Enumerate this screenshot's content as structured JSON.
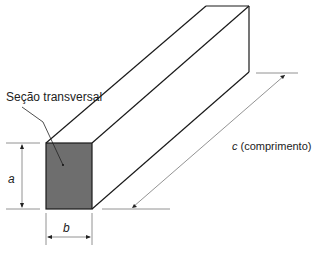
{
  "labels": {
    "cross_section": "Seção transversal",
    "a": "a",
    "b": "b",
    "c_var": "c",
    "c_desc": " (comprimento)"
  },
  "colors": {
    "face_fill": "#6e6e6e",
    "stroke": "#1a1a1a",
    "dim_line": "#777777"
  }
}
